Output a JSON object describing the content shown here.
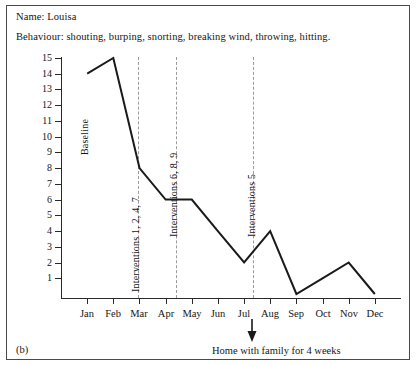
{
  "header": {
    "name_label": "Name:",
    "name_value": "Louisa",
    "name_line": "Name:  Louisa",
    "behaviour_label": "Behaviour:",
    "behaviour_value": "shouting, burping, snorting, breaking wind, throwing, hitting.",
    "behaviour_line": "Behaviour:  shouting, burping, snorting, breaking wind, throwing, hitting."
  },
  "figure": {
    "label": "(b)",
    "bottom_caption": "Home with family for 4 weeks",
    "arrow_icon": "down-arrow-icon",
    "arrow_target_month": "Aug"
  },
  "chart_data": {
    "type": "line",
    "title": "",
    "xlabel": "",
    "ylabel": "",
    "categories": [
      "Jan",
      "Feb",
      "Mar",
      "Apr",
      "May",
      "Jun",
      "Jul",
      "Aug",
      "Sep",
      "Oct",
      "Nov",
      "Dec"
    ],
    "values": [
      14,
      15,
      8,
      6,
      6,
      4,
      2,
      4,
      0,
      1,
      2,
      0
    ],
    "series": [
      {
        "name": "Behaviour incidents",
        "values": [
          14,
          15,
          8,
          6,
          6,
          4,
          2,
          4,
          0,
          1,
          2,
          0
        ]
      }
    ],
    "ylim": [
      0,
      15
    ],
    "yticks": [
      1,
      2,
      3,
      4,
      5,
      6,
      7,
      8,
      9,
      10,
      11,
      12,
      13,
      14,
      15
    ],
    "ytick_labels": [
      "1",
      "2",
      "3",
      "4",
      "5",
      "6",
      "7",
      "8",
      "9",
      "10",
      "11",
      "12",
      "13",
      "14",
      "15"
    ],
    "grid": false,
    "legend": "none",
    "line_color": "#1a1a1a",
    "annotations": [
      {
        "text": "Baseline",
        "at_x": "Jan",
        "orientation": "vertical"
      },
      {
        "text": "Interventions 1, 2, 4, 7",
        "at_x": "Feb-Mar",
        "orientation": "vertical",
        "marker": "dashed-vertical-line"
      },
      {
        "text": "Interventions 6, 8, 9",
        "at_x": "Mar-Apr",
        "orientation": "vertical",
        "marker": "dashed-vertical-line"
      },
      {
        "text": "Interventions 5",
        "at_x": "Jun-Jul",
        "orientation": "vertical",
        "marker": "dashed-vertical-line"
      }
    ]
  }
}
